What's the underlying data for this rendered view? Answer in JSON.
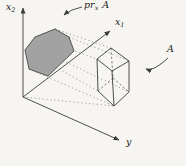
{
  "labels": {
    "axis_x2": {
      "base": "x",
      "sub": "2"
    },
    "axis_x1": {
      "base": "x",
      "sub": "1"
    },
    "axis_y": {
      "text": "y"
    },
    "projection": {
      "base": "pr",
      "sub": "x",
      "operand": "A"
    },
    "set": {
      "text": "A"
    }
  },
  "colors": {
    "background": "#f6f5f1",
    "line": "#3c3c3c",
    "ray": "#8e8e8e",
    "projection_fill": "#a2a2a2",
    "projection_stroke": "#454545"
  }
}
